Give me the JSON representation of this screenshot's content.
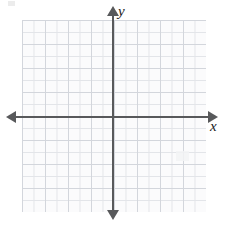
{
  "figure": {
    "background_color": "#ffffff"
  },
  "chart_data": {
    "type": "scatter",
    "title": "",
    "subtitle": "",
    "xlabel": "x",
    "ylabel": "y",
    "x": [],
    "y": [],
    "series": [],
    "annotations": [],
    "legend": [],
    "legend_position": "none",
    "grid": true,
    "grid_color": "#e2e4e8",
    "grid_major_color": "#d3d6dc",
    "grid_cells_x": 16,
    "grid_cells_y": 16,
    "tick_labels_x": [],
    "tick_labels_y": [],
    "xlim": [
      -8,
      8
    ],
    "ylim": [
      -8,
      8
    ],
    "origin_x": 8,
    "origin_y": 8,
    "axis_color": "#58595b",
    "axis_arrows": [
      "left",
      "right",
      "up",
      "down"
    ],
    "note": "Empty Cartesian grid with no plotted data points or curves"
  },
  "axes": {
    "x_label": "x",
    "y_label": "y"
  },
  "icons": {
    "arrow_right": "x-axis-arrow-right",
    "arrow_left": "x-axis-arrow-left",
    "arrow_up": "y-axis-arrow-up",
    "arrow_down": "y-axis-arrow-down"
  }
}
